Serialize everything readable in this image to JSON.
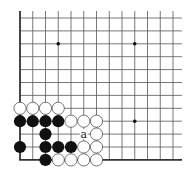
{
  "diagram": {
    "type": "go-board-fragment",
    "corner": "bottom-left",
    "columns": 13,
    "rows": 12,
    "grid": {
      "x0": 20,
      "y0": 18,
      "dx": 12.75,
      "dy": 12.9,
      "top_open_y": 11,
      "right_open_x": 182
    },
    "colors": {
      "line": "#555555",
      "edge": "#333333",
      "black_stone": "#111111",
      "white_stone": "#ffffff",
      "white_outline": "#555555",
      "background": "#ffffff"
    },
    "star_points": [
      {
        "col": 3,
        "row": 2
      },
      {
        "col": 9,
        "row": 2
      },
      {
        "col": 9,
        "row": 8
      }
    ],
    "stones": [
      {
        "color": "white",
        "col": 0,
        "row": 7
      },
      {
        "color": "white",
        "col": 1,
        "row": 7
      },
      {
        "color": "white",
        "col": 2,
        "row": 7
      },
      {
        "color": "white",
        "col": 3,
        "row": 7
      },
      {
        "color": "black",
        "col": 0,
        "row": 8
      },
      {
        "color": "black",
        "col": 1,
        "row": 8
      },
      {
        "color": "black",
        "col": 2,
        "row": 8
      },
      {
        "color": "black",
        "col": 3,
        "row": 8
      },
      {
        "color": "white",
        "col": 4,
        "row": 8
      },
      {
        "color": "white",
        "col": 5,
        "row": 8
      },
      {
        "color": "white",
        "col": 6,
        "row": 8
      },
      {
        "color": "black",
        "col": 2,
        "row": 9
      },
      {
        "color": "white",
        "col": 6,
        "row": 9
      },
      {
        "color": "black",
        "col": 0,
        "row": 10
      },
      {
        "color": "black",
        "col": 2,
        "row": 10
      },
      {
        "color": "black",
        "col": 3,
        "row": 10
      },
      {
        "color": "black",
        "col": 4,
        "row": 10
      },
      {
        "color": "white",
        "col": 5,
        "row": 10
      },
      {
        "color": "white",
        "col": 6,
        "row": 10
      },
      {
        "color": "black",
        "col": 2,
        "row": 11
      },
      {
        "color": "white",
        "col": 3,
        "row": 11
      },
      {
        "color": "white",
        "col": 4,
        "row": 11
      },
      {
        "color": "white",
        "col": 5,
        "row": 11
      },
      {
        "color": "white",
        "col": 6,
        "row": 11
      }
    ],
    "labels": [
      {
        "text": "a",
        "col": 5,
        "row": 9
      }
    ]
  }
}
